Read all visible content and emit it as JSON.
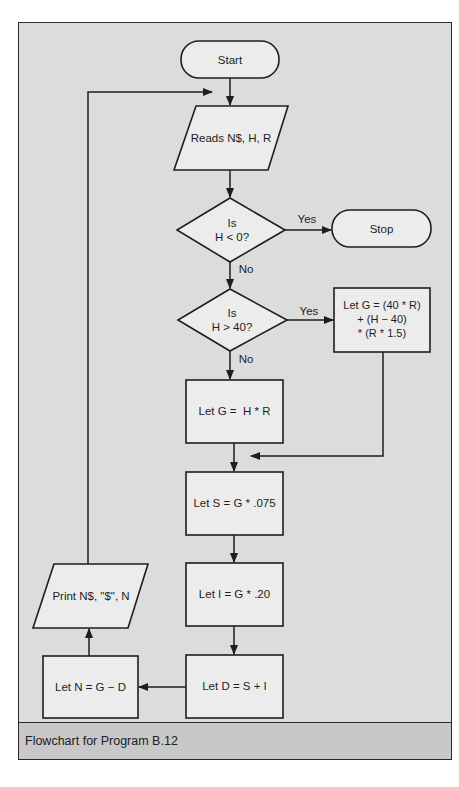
{
  "figure": {
    "caption": "Flowchart for Program B.12",
    "colors": {
      "frame_fill": "#dcdcdc",
      "caption_fill": "#c8c8c8",
      "shape_fill": "#ececec",
      "stroke": "#1e1e1e"
    }
  },
  "nodes": {
    "start": {
      "type": "terminal",
      "label": "Start"
    },
    "read_input": {
      "type": "io",
      "label": "Reads N$, H, R"
    },
    "decision_h_negative": {
      "type": "decision",
      "label": "Is\nH < 0?"
    },
    "stop": {
      "type": "terminal",
      "label": "Stop"
    },
    "decision_overtime": {
      "type": "decision",
      "label": "Is\nH > 40?"
    },
    "overtime_pay": {
      "type": "process",
      "label": "Let G = (40 * R)\n+ (H − 40)\n* (R * 1.5)"
    },
    "regular_pay": {
      "type": "process",
      "label": "Let G =  H * R"
    },
    "calc_s": {
      "type": "process",
      "label": "Let S = G * .075"
    },
    "calc_i": {
      "type": "process",
      "label": "Let I = G * .20"
    },
    "calc_d": {
      "type": "process",
      "label": "Let D = S + I"
    },
    "calc_n": {
      "type": "process",
      "label": "Let N = G − D"
    },
    "print_output": {
      "type": "io",
      "label": "Print N$, \"$\", N"
    }
  },
  "edges": {
    "yes_label_1": "Yes",
    "no_label_1": "No",
    "yes_label_2": "Yes",
    "no_label_2": "No"
  }
}
